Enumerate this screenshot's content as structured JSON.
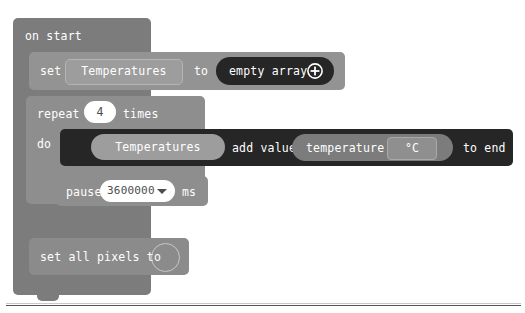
{
  "editor": {
    "type": "block-programming-editor",
    "palette": {
      "event_block": "#7c7c7c",
      "variable_block": "#939393",
      "loop_block": "#8e8e8e",
      "array_block": "#262626",
      "reporter_block": "#7c7c7c",
      "field_white": "#ffffff",
      "canvas_background": "#ffffff"
    }
  },
  "program": {
    "on_start": {
      "label": "on start",
      "statements": [
        {
          "name": "set-variable-statement",
          "keyword": "set",
          "variable": "Temperatures",
          "connector": "to",
          "value_block": {
            "label": "empty array",
            "icon": "plus-circle-icon"
          }
        },
        {
          "name": "repeat-loop-statement",
          "keyword": "repeat",
          "count": "4",
          "times_label": "times",
          "do_label": "do",
          "body": [
            {
              "name": "array-add-value-statement",
              "array_variable": "Temperatures",
              "add_value_label": "add value",
              "value_reporter": {
                "label": "temperature in",
                "unit": "°C"
              },
              "position_label": "to end"
            },
            {
              "name": "pause-statement",
              "keyword": "pause",
              "value": "3600000",
              "unit": "ms",
              "dropdown_icon": "chevron-down-icon"
            }
          ]
        },
        {
          "name": "set-all-pixels-statement",
          "label": "set all pixels to",
          "color_value": ""
        }
      ]
    }
  }
}
